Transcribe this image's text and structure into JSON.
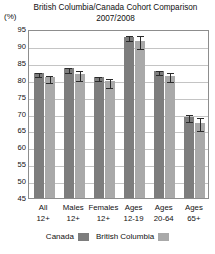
{
  "chart_data": {
    "type": "bar",
    "title": "British Columbia/Canada Cohort Comparison",
    "subtitle": "2007/2008",
    "units_label": "(%)",
    "xlabel": "",
    "ylabel": "",
    "ylim": [
      45,
      95
    ],
    "ytick_step": 5,
    "ytick_labels": [
      "95",
      "90",
      "85",
      "80",
      "75",
      "70",
      "65",
      "60",
      "55",
      "50",
      "45"
    ],
    "ytick_values": [
      95,
      90,
      85,
      80,
      75,
      70,
      65,
      60,
      55,
      50,
      45
    ],
    "grid": true,
    "legend_position": "bottom",
    "categories": [
      "All 12+",
      "Males 12+",
      "Females 12+",
      "Ages 12-19",
      "Ages 20-64",
      "Ages 65+"
    ],
    "category_lines": [
      {
        "line1": "All",
        "line2": "12+"
      },
      {
        "line1": "Males",
        "line2": "12+"
      },
      {
        "line1": "Females",
        "line2": "12+"
      },
      {
        "line1": "Ages",
        "line2": "12-19"
      },
      {
        "line1": "Ages",
        "line2": "20-64"
      },
      {
        "line1": "Ages",
        "line2": "65+"
      }
    ],
    "series": [
      {
        "name": "Canada",
        "color": "#7d7d7d",
        "values": [
          82.0,
          83.4,
          80.8,
          92.7,
          82.7,
          69.1
        ],
        "errors": [
          0.5,
          0.7,
          0.7,
          0.8,
          0.6,
          1.1
        ]
      },
      {
        "name": "British Columbia",
        "color": "#a9a9a9",
        "values": [
          80.7,
          81.8,
          79.5,
          91.6,
          81.2,
          67.3
        ],
        "errors": [
          1.1,
          1.5,
          1.4,
          1.8,
          1.3,
          1.9
        ]
      }
    ]
  },
  "legend": {
    "entries": [
      {
        "label": "Canada",
        "swatch": "canada"
      },
      {
        "label": "British Columbia",
        "swatch": "bc"
      }
    ]
  },
  "colors": {
    "canada": "#7d7d7d",
    "british_columbia": "#a9a9a9",
    "grid": "#c4c4c4",
    "frame": "#8d8d8d",
    "error_bar": "#2b2b2b",
    "background": "#ffffff"
  }
}
